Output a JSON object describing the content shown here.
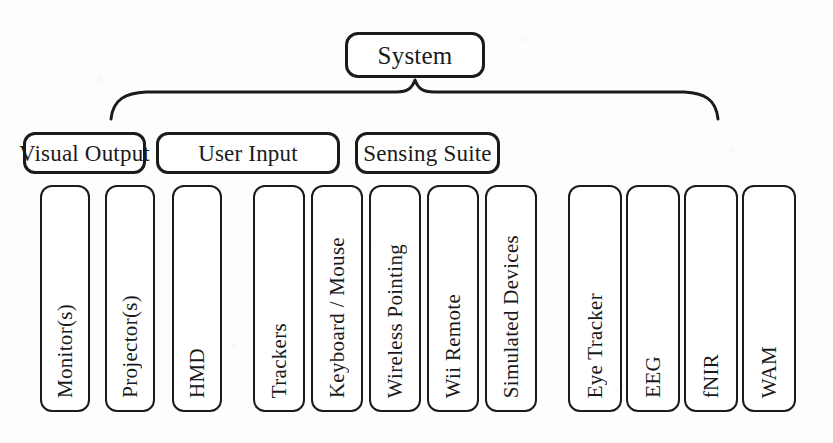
{
  "diagram": {
    "title": "System",
    "root": {
      "label": "System"
    },
    "connector": {
      "type": "curly-brace",
      "orientation": "horizontal-down"
    },
    "groups": [
      {
        "id": "visual-output",
        "label": "Visual Output",
        "items": [
          {
            "label": "Monitor(s)"
          },
          {
            "label": "Projector(s)"
          },
          {
            "label": "HMD"
          }
        ]
      },
      {
        "id": "user-input",
        "label": "User Input",
        "items": [
          {
            "label": "Trackers"
          },
          {
            "label": "Keyboard / Mouse"
          },
          {
            "label": "Wireless Pointing"
          },
          {
            "label": "Wii Remote"
          },
          {
            "label": "Simulated Devices"
          }
        ]
      },
      {
        "id": "sensing-suite",
        "label": "Sensing Suite",
        "items": [
          {
            "label": "Eye Tracker"
          },
          {
            "label": "EEG"
          },
          {
            "label": "fNIR"
          },
          {
            "label": "WAM"
          }
        ]
      }
    ],
    "colors": {
      "background": "#fdfdfc",
      "stroke": "#1b1b1b",
      "box_fill": "#ffffff",
      "text": "#1a1a1a"
    }
  },
  "layout": {
    "root_box": {
      "x": 345,
      "y": 32,
      "w": 140,
      "h": 46
    },
    "brace": {
      "left": 111,
      "right": 718,
      "y": 118,
      "apex_x": 415,
      "apex_y": 80
    },
    "group_boxes": [
      {
        "x": 23,
        "y": 132,
        "w": 123,
        "h": 42
      },
      {
        "x": 156,
        "y": 132,
        "w": 184,
        "h": 42
      },
      {
        "x": 355,
        "y": 132,
        "w": 145,
        "h": 42
      }
    ],
    "leaf_row": {
      "y": 185,
      "h": 227
    },
    "leaf_boxes": [
      {
        "x": 40,
        "w": 50
      },
      {
        "x": 105,
        "w": 50
      },
      {
        "x": 172,
        "w": 50
      },
      {
        "x": 253,
        "w": 52
      },
      {
        "x": 311,
        "w": 52
      },
      {
        "x": 369,
        "w": 52
      },
      {
        "x": 427,
        "w": 52
      },
      {
        "x": 485,
        "w": 52
      },
      {
        "x": 568,
        "w": 54
      },
      {
        "x": 626,
        "w": 54
      },
      {
        "x": 684,
        "w": 54
      },
      {
        "x": 742,
        "w": 54
      }
    ]
  }
}
